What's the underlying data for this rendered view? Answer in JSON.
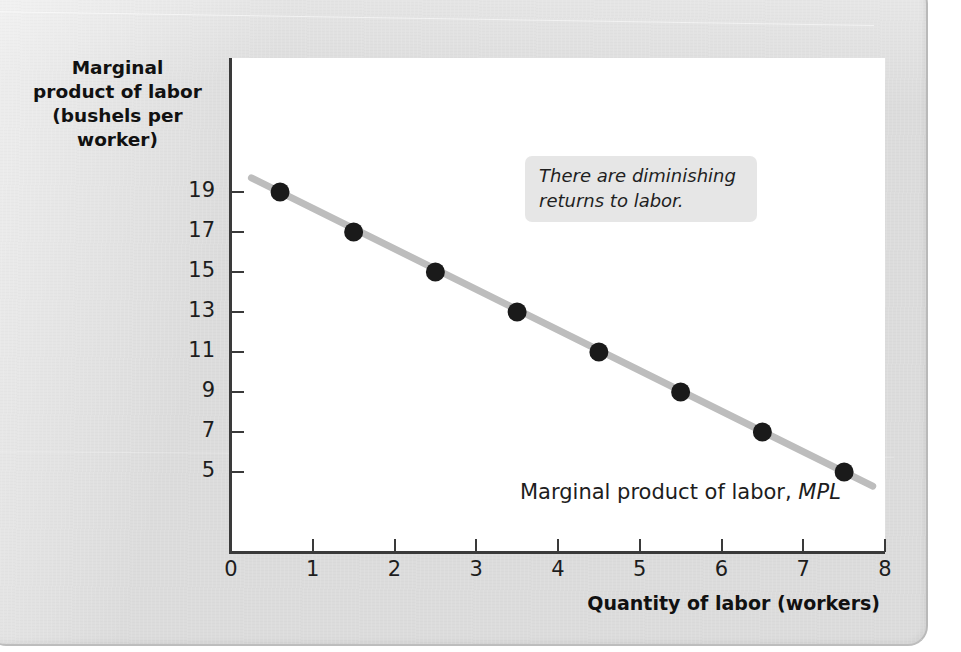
{
  "figure": {
    "panel_background": "#dcdcdc",
    "plot_background": "#ffffff",
    "axis_color": "#3a3a3a"
  },
  "annotation": {
    "text": "There are diminishing returns to labor.",
    "background": "#e6e6e6"
  },
  "series_label": {
    "text": "Marginal product of labor, ",
    "abbr": "MPL"
  },
  "chart_data": {
    "type": "line",
    "title": "",
    "xlabel": "Quantity of labor (workers)",
    "ylabel": "Marginal product of labor (bushels per worker)",
    "ylabel_lines": [
      "Marginal",
      "product of labor",
      "(bushels per",
      "worker)"
    ],
    "xlim": [
      0,
      8
    ],
    "ylim": [
      3,
      20
    ],
    "xticks": [
      0,
      1,
      2,
      3,
      4,
      5,
      6,
      7,
      8
    ],
    "xtick_labels": [
      "0",
      "1",
      "2",
      "3",
      "4",
      "5",
      "6",
      "7",
      "8"
    ],
    "yticks": [
      19,
      17,
      15,
      13,
      11,
      9,
      7,
      5
    ],
    "ytick_labels": [
      "19",
      "17",
      "15",
      "13",
      "11",
      "9",
      "7",
      "5"
    ],
    "grid": false,
    "legend": "none",
    "line_color": "#bdbdbd",
    "marker_color": "#1a1a1a",
    "x": [
      0.6,
      1.5,
      2.5,
      3.5,
      4.5,
      5.5,
      6.5,
      7.5
    ],
    "values": [
      19,
      17,
      15,
      13,
      11,
      9,
      7,
      5
    ],
    "series": [
      {
        "name": "Marginal product of labor, MPL",
        "x": [
          0.6,
          1.5,
          2.5,
          3.5,
          4.5,
          5.5,
          6.5,
          7.5
        ],
        "values": [
          19,
          17,
          15,
          13,
          11,
          9,
          7,
          5
        ]
      }
    ],
    "line_extent_x": [
      0.25,
      7.85
    ],
    "annotations": [
      "There are diminishing returns to labor."
    ]
  }
}
